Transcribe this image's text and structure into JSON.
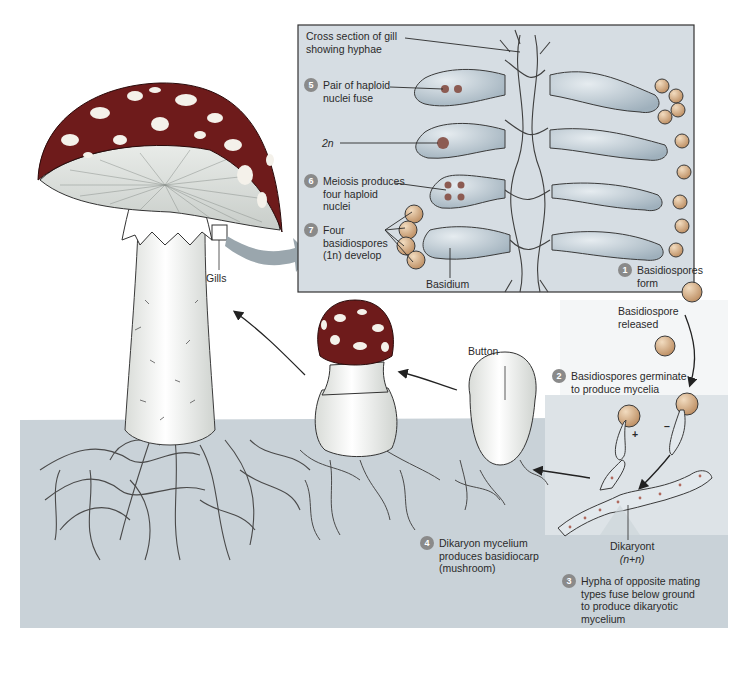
{
  "diagram": {
    "colors": {
      "background": "#ffffff",
      "ground": "#c9d2d8",
      "inset_bg": "#d6dde3",
      "inset_border": "#333333",
      "cap": "#6e1b1b",
      "cap_spots": "#f4f1ea",
      "stalk": "#f2f2ee",
      "hyphae_line": "#4a4a4a",
      "badge": "#8a8a8a",
      "cell_fill": "#b7c3cc",
      "nucleus": "#8c5b52",
      "spore_fill": "#c69a6a",
      "arrow": "#222222",
      "big_arrow": "#9aa6ad"
    },
    "inset": {
      "labels": {
        "cross_section": "Cross section of gill showing hyphae",
        "cross_section_l1": "Cross section of gill",
        "cross_section_l2": "showing hyphae",
        "two_n": "2n",
        "basidium": "Basidium"
      },
      "steps": [
        {
          "num": "5",
          "l1": "Pair of haploid",
          "l2": "nuclei fuse",
          "l3": ""
        },
        {
          "num": "6",
          "l1": "Meiosis produces",
          "l2": "four haploid",
          "l3": "nuclei"
        },
        {
          "num": "7",
          "l1": "Four",
          "l2": "basidiospores",
          "l3": "(1n) develop"
        }
      ]
    },
    "steps": [
      {
        "num": "1",
        "l1": "Basidiospores",
        "l2": "form",
        "l3": "",
        "l4": ""
      },
      {
        "num": "2",
        "l1": "Basidiospores germinate",
        "l2": "to produce mycelia",
        "l3": "",
        "l4": ""
      },
      {
        "num": "3",
        "l1": "Hypha of opposite mating",
        "l2": "types fuse below ground",
        "l3": "to produce dikaryotic",
        "l4": "mycelium"
      },
      {
        "num": "4",
        "l1": "Dikaryon mycelium",
        "l2": "produces basidiocarp",
        "l3": "(mushroom)",
        "l4": ""
      }
    ],
    "labels": {
      "gills": "Gills",
      "button": "Button",
      "basidiospore_released_l1": "Basidiospore",
      "basidiospore_released_l2": "released",
      "dikaryont": "Dikaryont",
      "dikaryont_ploidy": "(n+n)",
      "plus": "+",
      "minus": "–"
    }
  }
}
